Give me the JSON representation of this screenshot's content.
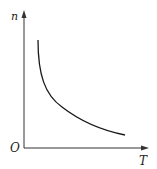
{
  "diagram": {
    "type": "line",
    "axes": {
      "y_label": "n",
      "x_label": "T",
      "origin_label": "O"
    },
    "curve": {
      "shape": "monotonically decreasing, convex (hyperbola-like)",
      "points_px": [
        [
          38,
          40
        ],
        [
          39,
          60
        ],
        [
          43,
          78
        ],
        [
          50,
          93
        ],
        [
          60,
          105
        ],
        [
          72,
          115
        ],
        [
          88,
          124
        ],
        [
          105,
          130
        ],
        [
          125,
          135
        ]
      ]
    },
    "colors": {
      "axis": "#333333",
      "curve": "#1a1a1a",
      "background": "#ffffff"
    }
  }
}
